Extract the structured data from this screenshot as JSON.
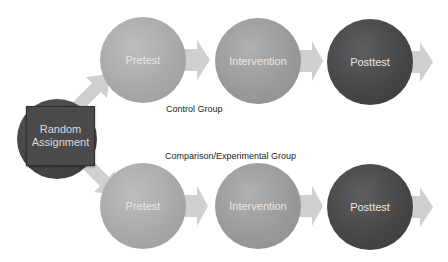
{
  "diagram": {
    "start_node": {
      "line1": "Random",
      "line2": "Assignment"
    },
    "groups": [
      {
        "label": "Control Group",
        "steps": [
          {
            "label": "Pretest",
            "shade": "light"
          },
          {
            "label": "Intervention",
            "shade": "mid"
          },
          {
            "label": "Posttest",
            "shade": "dark"
          }
        ]
      },
      {
        "label": "Comparison/Experimental Group",
        "steps": [
          {
            "label": "Pretest",
            "shade": "light"
          },
          {
            "label": "Intervention",
            "shade": "mid"
          },
          {
            "label": "Posttest",
            "shade": "dark"
          }
        ]
      }
    ],
    "colors": {
      "light_node": "#a9a9a9",
      "mid_node": "#9a9a9a",
      "dark_node": "#474747",
      "arrow": "#cfcfcf",
      "start_node": "#4a4a4a"
    }
  }
}
